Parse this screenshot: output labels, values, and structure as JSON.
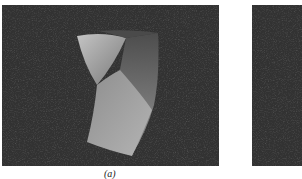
{
  "figure": {
    "panels": [
      {
        "id": "a",
        "caption": "(a)",
        "content": "rendered twisted bar on dark background"
      },
      {
        "id": "b",
        "caption": "",
        "content": "dark background (cropped)"
      }
    ],
    "colors": {
      "background": "#333333",
      "shape_light": "#b8b8b8",
      "shape_mid": "#8a8a8a",
      "shape_dark": "#5a5a5a"
    }
  }
}
